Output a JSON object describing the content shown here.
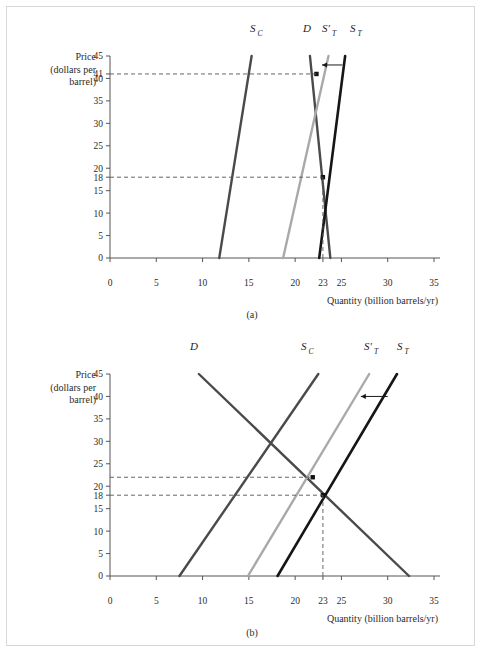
{
  "figure": {
    "panel_a_caption": "(a)",
    "panel_b_caption": "(b)"
  },
  "axes": {
    "y_title_line1": "Price",
    "y_title_line2": "(dollars per",
    "y_title_line3": "barrel)",
    "x_title": "Quantity (billion barrels/yr)"
  },
  "curve_labels": {
    "supply_competitive": "S",
    "supply_competitive_sub": "C",
    "demand": "D",
    "supply_total_shifted": "S'",
    "supply_total_shifted_sub": "T",
    "supply_total": "S",
    "supply_total_sub": "T"
  },
  "colors": {
    "demand": "#4a4a4a",
    "supply_competitive": "#4a4a4a",
    "supply_total_shifted": "#a9a9a9",
    "supply_total": "#161616",
    "axis": "#555555",
    "frame": "#d8d8d8"
  },
  "chart_data": [
    {
      "type": "line",
      "title": "(a)",
      "xlabel": "Quantity (billion barrels/yr)",
      "ylabel": "Price (dollars per barrel)",
      "xlim": [
        0,
        35
      ],
      "ylim": [
        0,
        45
      ],
      "grid": false,
      "legend": "inline-curve-labels",
      "xticks": [
        0,
        5,
        10,
        15,
        20,
        23,
        25,
        30,
        35
      ],
      "yticks": [
        0,
        5,
        10,
        15,
        18,
        20,
        25,
        30,
        35,
        40,
        41,
        45
      ],
      "series": [
        {
          "name": "S_C",
          "color": "#4a4a4a",
          "points": [
            [
              11.8,
              0
            ],
            [
              15.3,
              45
            ]
          ]
        },
        {
          "name": "D",
          "color": "#4a4a4a",
          "points": [
            [
              23.8,
              0
            ],
            [
              21.6,
              45
            ]
          ]
        },
        {
          "name": "S'_T",
          "color": "#a9a9a9",
          "points": [
            [
              18.7,
              0
            ],
            [
              23.6,
              45
            ]
          ]
        },
        {
          "name": "S_T",
          "color": "#161616",
          "points": [
            [
              22.6,
              0
            ],
            [
              25.4,
              45
            ]
          ]
        }
      ],
      "annotations": [
        {
          "kind": "equilibrium-point",
          "x": 22.3,
          "y": 41,
          "label": "41"
        },
        {
          "kind": "equilibrium-point",
          "x": 23.0,
          "y": 18,
          "label": "18"
        },
        {
          "kind": "dashed-guide",
          "from": [
            0,
            41
          ],
          "to": [
            22.3,
            41
          ]
        },
        {
          "kind": "dashed-guide",
          "from": [
            0,
            18
          ],
          "to": [
            23.0,
            18
          ]
        },
        {
          "kind": "dashed-guide",
          "from": [
            23.0,
            0
          ],
          "to": [
            23.0,
            18
          ]
        },
        {
          "kind": "shift-arrow",
          "from": [
            25.1,
            43
          ],
          "to": [
            22.9,
            43
          ],
          "direction": "left"
        }
      ]
    },
    {
      "type": "line",
      "title": "(b)",
      "xlabel": "Quantity (billion barrels/yr)",
      "ylabel": "Price (dollars per barrel)",
      "xlim": [
        0,
        35
      ],
      "ylim": [
        0,
        45
      ],
      "grid": false,
      "legend": "inline-curve-labels",
      "xticks": [
        0,
        5,
        10,
        15,
        20,
        23,
        25,
        30,
        35
      ],
      "yticks": [
        0,
        5,
        10,
        15,
        18,
        20,
        25,
        30,
        35,
        40,
        45
      ],
      "series": [
        {
          "name": "D",
          "color": "#4a4a4a",
          "points": [
            [
              9.6,
              45
            ],
            [
              32.3,
              0
            ]
          ]
        },
        {
          "name": "S_C",
          "color": "#4a4a4a",
          "points": [
            [
              7.5,
              0
            ],
            [
              22.5,
              45
            ]
          ]
        },
        {
          "name": "S'_T",
          "color": "#a9a9a9",
          "points": [
            [
              14.9,
              0
            ],
            [
              28.0,
              45
            ]
          ]
        },
        {
          "name": "S_T",
          "color": "#161616",
          "points": [
            [
              18.1,
              0
            ],
            [
              31.0,
              45
            ]
          ]
        }
      ],
      "annotations": [
        {
          "kind": "equilibrium-point",
          "x": 21.9,
          "y": 22,
          "label": "22"
        },
        {
          "kind": "equilibrium-point",
          "x": 23.0,
          "y": 18,
          "label": "18"
        },
        {
          "kind": "dashed-guide",
          "from": [
            0,
            22
          ],
          "to": [
            21.9,
            22
          ]
        },
        {
          "kind": "dashed-guide",
          "from": [
            0,
            18
          ],
          "to": [
            23.0,
            18
          ]
        },
        {
          "kind": "dashed-guide",
          "from": [
            23.0,
            0
          ],
          "to": [
            23.0,
            18
          ]
        },
        {
          "kind": "shift-arrow",
          "from": [
            30.0,
            40
          ],
          "to": [
            27.1,
            40
          ],
          "direction": "left"
        }
      ]
    }
  ]
}
